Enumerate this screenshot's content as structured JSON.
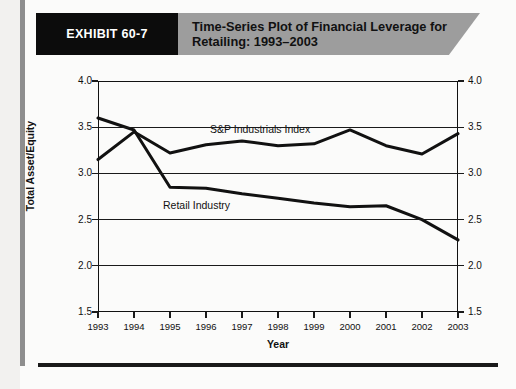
{
  "exhibit": {
    "chip_label": "EXHIBIT 60-7",
    "title": "Time-Series Plot of Financial Leverage for Retailing: 1993–2003"
  },
  "chart_data": {
    "type": "line",
    "title": "Time-Series Plot of Financial Leverage for Retailing: 1993–2003",
    "xlabel": "Year",
    "ylabel": "Total Asset/Equity",
    "x": [
      1993,
      1994,
      1995,
      1996,
      1997,
      1998,
      1999,
      2000,
      2001,
      2002,
      2003
    ],
    "categories": [
      "1993",
      "1994",
      "1995",
      "1996",
      "1997",
      "1998",
      "1999",
      "2000",
      "2001",
      "2002",
      "2003"
    ],
    "xlim": [
      1993,
      2003
    ],
    "ylim": [
      1.5,
      4.0
    ],
    "yticks": [
      1.5,
      2.0,
      2.5,
      3.0,
      3.5,
      4.0
    ],
    "ytick_labels": [
      "1.5",
      "2.0",
      "2.5",
      "3.0",
      "3.5",
      "4.0"
    ],
    "grid": true,
    "legend": "inline-labels",
    "series": [
      {
        "name": "S&P Industrials Index",
        "values": [
          3.15,
          3.45,
          3.22,
          3.31,
          3.35,
          3.3,
          3.32,
          3.47,
          3.3,
          3.21,
          3.43
        ]
      },
      {
        "name": "Retail Industry",
        "values": [
          3.6,
          3.47,
          2.85,
          2.84,
          2.78,
          2.73,
          2.68,
          2.64,
          2.65,
          2.5,
          2.28
        ]
      }
    ],
    "annotations": [
      {
        "text": "S&P Industrials Index",
        "x": 1996.5,
        "y": 3.55
      },
      {
        "text": "Retail Industry",
        "x": 1995.5,
        "y": 2.58
      }
    ]
  }
}
